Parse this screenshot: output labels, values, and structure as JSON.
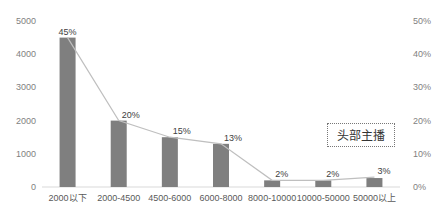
{
  "header": {
    "cropped_title": ""
  },
  "annotation": {
    "text": "头部主播"
  },
  "chart_data": {
    "type": "bar",
    "title": "",
    "xlabel": "",
    "ylabel": "",
    "categories": [
      "2000以下",
      "2000-4500",
      "4500-6000",
      "6000-8000",
      "8000-10000",
      "10000-50000",
      "50000以上"
    ],
    "series": [
      {
        "name": "count",
        "type": "bar",
        "axis": "left",
        "values": [
          4500,
          2000,
          1500,
          1300,
          200,
          200,
          270
        ],
        "color": "#7f7f7f"
      },
      {
        "name": "percentage",
        "type": "line",
        "axis": "right",
        "values": [
          45,
          20,
          15,
          13,
          2,
          2,
          3
        ],
        "labels": [
          "45%",
          "20%",
          "15%",
          "13%",
          "2%",
          "2%",
          "3%"
        ],
        "color": "#bfbfbf"
      }
    ],
    "ylim": [
      0,
      5000
    ],
    "yticks": [
      "0",
      "1000",
      "2000",
      "3000",
      "4000",
      "5000"
    ],
    "y2lim": [
      0,
      50
    ],
    "y2ticks": [
      "0%",
      "10%",
      "20%",
      "30%",
      "40%",
      "50%"
    ],
    "grid": false,
    "legend": "none"
  }
}
